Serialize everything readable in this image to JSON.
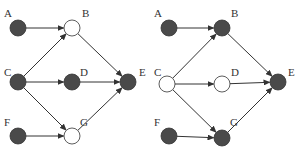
{
  "colors": {
    "filled": "#4a4a4a",
    "empty": "#ffffff",
    "stroke": "#333333"
  },
  "graphs": [
    {
      "name": "left-graph",
      "offset_x": 0,
      "nodes": [
        {
          "id": "A",
          "label": "A",
          "x": 18,
          "y": 28,
          "filled": true,
          "lx": 4,
          "ly": 17
        },
        {
          "id": "B",
          "label": "B",
          "x": 72,
          "y": 28,
          "filled": false,
          "lx": 82,
          "ly": 17
        },
        {
          "id": "C",
          "label": "C",
          "x": 18,
          "y": 82,
          "filled": true,
          "lx": 4,
          "ly": 76
        },
        {
          "id": "D",
          "label": "D",
          "x": 72,
          "y": 82,
          "filled": true,
          "lx": 80,
          "ly": 76
        },
        {
          "id": "E",
          "label": "E",
          "x": 128,
          "y": 82,
          "filled": true,
          "lx": 139,
          "ly": 76
        },
        {
          "id": "F",
          "label": "F",
          "x": 18,
          "y": 136,
          "filled": true,
          "lx": 4,
          "ly": 126
        },
        {
          "id": "G",
          "label": "G",
          "x": 72,
          "y": 136,
          "filled": false,
          "lx": 80,
          "ly": 126
        }
      ]
    },
    {
      "name": "right-graph",
      "offset_x": 149,
      "nodes": [
        {
          "id": "A",
          "label": "A",
          "x": 20,
          "y": 28,
          "filled": true,
          "lx": 5,
          "ly": 17
        },
        {
          "id": "B",
          "label": "B",
          "x": 73,
          "y": 28,
          "filled": true,
          "lx": 82,
          "ly": 17
        },
        {
          "id": "C",
          "label": "C",
          "x": 18,
          "y": 84,
          "filled": false,
          "lx": 5,
          "ly": 76
        },
        {
          "id": "D",
          "label": "D",
          "x": 73,
          "y": 84,
          "filled": false,
          "lx": 82,
          "ly": 76
        },
        {
          "id": "E",
          "label": "E",
          "x": 129,
          "y": 82,
          "filled": true,
          "lx": 139,
          "ly": 76
        },
        {
          "id": "F",
          "label": "F",
          "x": 20,
          "y": 136,
          "filled": true,
          "lx": 5,
          "ly": 126
        },
        {
          "id": "G",
          "label": "G",
          "x": 73,
          "y": 138,
          "filled": true,
          "lx": 81,
          "ly": 126
        }
      ]
    }
  ],
  "edges": [
    {
      "from": "A",
      "to": "B"
    },
    {
      "from": "C",
      "to": "B"
    },
    {
      "from": "C",
      "to": "D"
    },
    {
      "from": "C",
      "to": "G"
    },
    {
      "from": "F",
      "to": "G"
    },
    {
      "from": "B",
      "to": "E"
    },
    {
      "from": "D",
      "to": "E"
    },
    {
      "from": "G",
      "to": "E"
    }
  ],
  "node_radius": 8
}
